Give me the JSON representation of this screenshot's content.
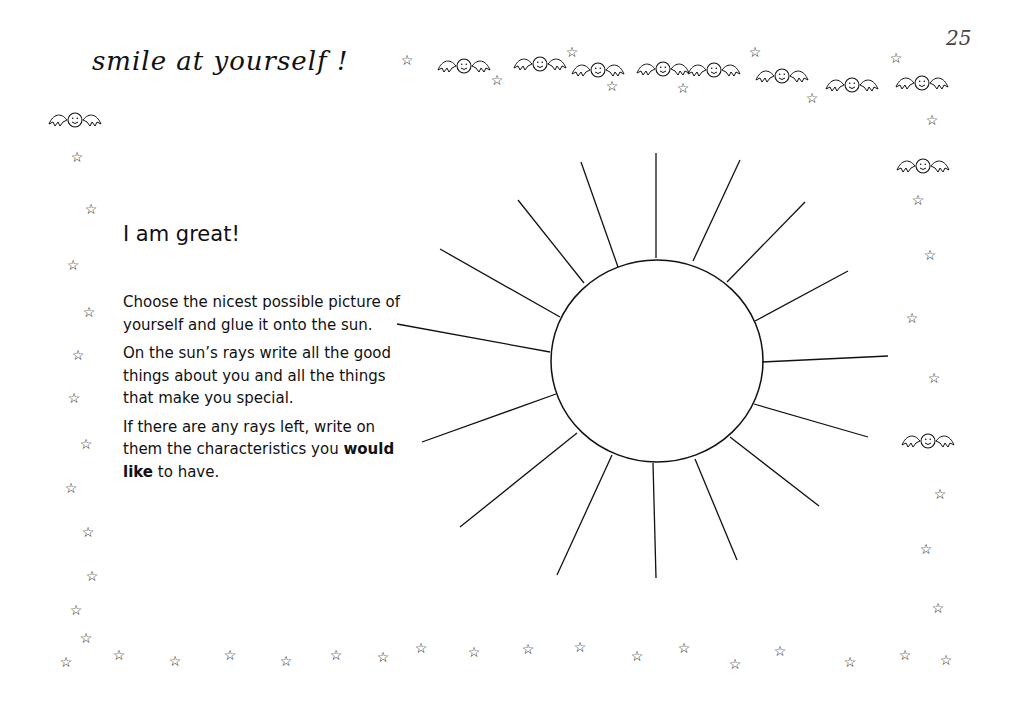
{
  "header": {
    "title": "smile at yourself !",
    "page_number": "25"
  },
  "activity": {
    "title": "I am great!",
    "paragraphs": [
      "Choose the nicest possible picture of yourself and glue it onto the sun.",
      "On the sun’s rays write all the good things about you and all the things that make you special.",
      "If there are any rays left, write on them the characteristics you"
    ],
    "emphasis": "would like",
    "ending": " to have."
  },
  "illustration": {
    "name": "sun",
    "ray_count": 18,
    "icons": [
      "star-icon",
      "winged-smiley-icon"
    ]
  }
}
